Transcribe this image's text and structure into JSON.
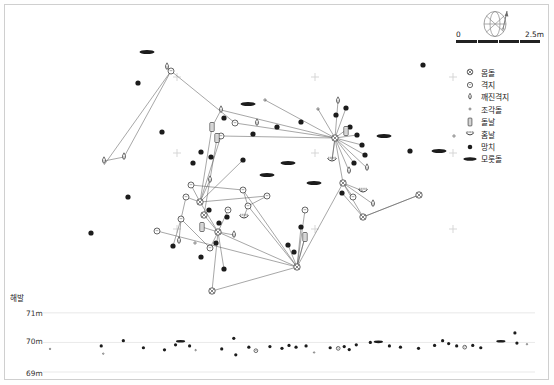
{
  "figure": {
    "type": "archaeological-artifact-distribution-map",
    "elevation_label": "해발",
    "elevation_ticks": [
      "71m",
      "70m",
      "69m"
    ]
  },
  "scalebar": {
    "min": "0",
    "max": "2.5m"
  },
  "compass": {
    "name": "north-arrow-compass-rose"
  },
  "legend": {
    "items": [
      {
        "symbol": "core-circle-cross",
        "label": "몸돌"
      },
      {
        "symbol": "flake-circle",
        "label": "격지"
      },
      {
        "symbol": "broken-flake-teardrop",
        "label": "깨진격지"
      },
      {
        "symbol": "fragment-tiny-dot",
        "label": "조각돌"
      },
      {
        "symbol": "blade-rectangle",
        "label": "돌날"
      },
      {
        "symbol": "notch-crescent",
        "label": "홈날"
      },
      {
        "symbol": "hammerstone-filled-dot",
        "label": "망치"
      },
      {
        "symbol": "anvil-ellipse",
        "label": "모룻돌"
      }
    ]
  },
  "chart_data": {
    "type": "scatter",
    "title": "",
    "xlabel": "",
    "ylabel": "해발",
    "grid": false,
    "legend_position": "right",
    "plan_view": {
      "xlim": [
        0,
        543
      ],
      "ylim": [
        0,
        285
      ],
      "grid_crosses": [
        [
          172,
          72
        ],
        [
          310,
          72
        ],
        [
          172,
          148
        ],
        [
          310,
          148
        ],
        [
          172,
          224
        ],
        [
          310,
          224
        ],
        [
          448,
          148
        ],
        [
          448,
          224
        ],
        [
          448,
          72
        ]
      ],
      "points": [
        {
          "t": "anvil",
          "x": 142,
          "y": 47
        },
        {
          "t": "anvil",
          "x": 243,
          "y": 99
        },
        {
          "t": "anvil",
          "x": 283,
          "y": 158
        },
        {
          "t": "anvil",
          "x": 309,
          "y": 178
        },
        {
          "t": "anvil",
          "x": 379,
          "y": 131
        },
        {
          "t": "anvil",
          "x": 434,
          "y": 146
        },
        {
          "t": "anvil",
          "x": 262,
          "y": 170
        },
        {
          "t": "hammer",
          "x": 133,
          "y": 78
        },
        {
          "t": "hammer",
          "x": 157,
          "y": 127
        },
        {
          "t": "hammer",
          "x": 123,
          "y": 192
        },
        {
          "t": "hammer",
          "x": 86,
          "y": 228
        },
        {
          "t": "hammer",
          "x": 219,
          "y": 113
        },
        {
          "t": "hammer",
          "x": 248,
          "y": 129
        },
        {
          "t": "hammer",
          "x": 272,
          "y": 122
        },
        {
          "t": "hammer",
          "x": 296,
          "y": 117
        },
        {
          "t": "hammer",
          "x": 331,
          "y": 110
        },
        {
          "t": "hammer",
          "x": 341,
          "y": 103
        },
        {
          "t": "hammer",
          "x": 345,
          "y": 122
        },
        {
          "t": "hammer",
          "x": 352,
          "y": 130
        },
        {
          "t": "hammer",
          "x": 357,
          "y": 140
        },
        {
          "t": "hammer",
          "x": 360,
          "y": 150
        },
        {
          "t": "hammer",
          "x": 349,
          "y": 158
        },
        {
          "t": "hammer",
          "x": 418,
          "y": 60
        },
        {
          "t": "hammer",
          "x": 405,
          "y": 146
        },
        {
          "t": "hammer",
          "x": 188,
          "y": 158
        },
        {
          "t": "hammer",
          "x": 204,
          "y": 205
        },
        {
          "t": "hammer",
          "x": 214,
          "y": 218
        },
        {
          "t": "hammer",
          "x": 222,
          "y": 212
        },
        {
          "t": "hammer",
          "x": 211,
          "y": 238
        },
        {
          "t": "hammer",
          "x": 196,
          "y": 252
        },
        {
          "t": "hammer",
          "x": 219,
          "y": 264
        },
        {
          "t": "hammer",
          "x": 283,
          "y": 240
        },
        {
          "t": "hammer",
          "x": 289,
          "y": 247
        },
        {
          "t": "hammer",
          "x": 296,
          "y": 222
        },
        {
          "t": "hammer",
          "x": 337,
          "y": 188
        },
        {
          "t": "hammer",
          "x": 168,
          "y": 241
        },
        {
          "t": "hammer",
          "x": 238,
          "y": 155
        },
        {
          "t": "hammer",
          "x": 196,
          "y": 147
        },
        {
          "t": "hammer",
          "x": 206,
          "y": 152
        },
        {
          "t": "core",
          "x": 195,
          "y": 197
        },
        {
          "t": "core",
          "x": 199,
          "y": 210
        },
        {
          "t": "core",
          "x": 213,
          "y": 227
        },
        {
          "t": "core",
          "x": 292,
          "y": 262
        },
        {
          "t": "core",
          "x": 207,
          "y": 286
        },
        {
          "t": "core",
          "x": 358,
          "y": 212
        },
        {
          "t": "core",
          "x": 414,
          "y": 190
        },
        {
          "t": "core",
          "x": 338,
          "y": 178
        },
        {
          "t": "core",
          "x": 330,
          "y": 133
        },
        {
          "t": "flake",
          "x": 166,
          "y": 66
        },
        {
          "t": "flake",
          "x": 216,
          "y": 131
        },
        {
          "t": "flake",
          "x": 230,
          "y": 118
        },
        {
          "t": "flake",
          "x": 238,
          "y": 185
        },
        {
          "t": "flake",
          "x": 262,
          "y": 191
        },
        {
          "t": "flake",
          "x": 186,
          "y": 180
        },
        {
          "t": "flake",
          "x": 176,
          "y": 214
        },
        {
          "t": "flake",
          "x": 152,
          "y": 226
        },
        {
          "t": "flake",
          "x": 205,
          "y": 243
        },
        {
          "t": "flake",
          "x": 243,
          "y": 201
        },
        {
          "t": "flake",
          "x": 300,
          "y": 205
        },
        {
          "t": "flake",
          "x": 181,
          "y": 192
        },
        {
          "t": "flake",
          "x": 223,
          "y": 205
        },
        {
          "t": "flake",
          "x": 348,
          "y": 192
        },
        {
          "t": "brokenflake",
          "x": 99,
          "y": 156
        },
        {
          "t": "brokenflake",
          "x": 119,
          "y": 152
        },
        {
          "t": "brokenflake",
          "x": 162,
          "y": 62
        },
        {
          "t": "brokenflake",
          "x": 216,
          "y": 105
        },
        {
          "t": "brokenflake",
          "x": 252,
          "y": 118
        },
        {
          "t": "brokenflake",
          "x": 333,
          "y": 96
        },
        {
          "t": "brokenflake",
          "x": 344,
          "y": 166
        },
        {
          "t": "brokenflake",
          "x": 362,
          "y": 163
        },
        {
          "t": "brokenflake",
          "x": 368,
          "y": 199
        },
        {
          "t": "brokenflake",
          "x": 205,
          "y": 175
        },
        {
          "t": "brokenflake",
          "x": 174,
          "y": 236
        },
        {
          "t": "brokenflake",
          "x": 229,
          "y": 230
        },
        {
          "t": "blade",
          "x": 207,
          "y": 122
        },
        {
          "t": "blade",
          "x": 212,
          "y": 133
        },
        {
          "t": "blade",
          "x": 341,
          "y": 126
        },
        {
          "t": "blade",
          "x": 197,
          "y": 222
        },
        {
          "t": "blade",
          "x": 300,
          "y": 232
        },
        {
          "t": "notch",
          "x": 327,
          "y": 155
        },
        {
          "t": "notch",
          "x": 358,
          "y": 186
        },
        {
          "t": "notch",
          "x": 239,
          "y": 212
        },
        {
          "t": "fragment",
          "x": 260,
          "y": 95
        },
        {
          "t": "fragment",
          "x": 313,
          "y": 104
        },
        {
          "t": "fragment",
          "x": 449,
          "y": 131
        },
        {
          "t": "fragment",
          "x": 190,
          "y": 238
        }
      ],
      "refit_lines": [
        [
          99,
          160,
          166,
          66
        ],
        [
          119,
          152,
          166,
          66
        ],
        [
          166,
          66,
          230,
          118
        ],
        [
          216,
          105,
          330,
          133
        ],
        [
          230,
          118,
          330,
          133
        ],
        [
          216,
          131,
          330,
          133
        ],
        [
          330,
          133,
          341,
          103
        ],
        [
          330,
          133,
          333,
          96
        ],
        [
          330,
          133,
          345,
          122
        ],
        [
          330,
          133,
          352,
          130
        ],
        [
          330,
          133,
          357,
          140
        ],
        [
          330,
          133,
          360,
          150
        ],
        [
          330,
          133,
          349,
          158
        ],
        [
          330,
          133,
          344,
          166
        ],
        [
          330,
          133,
          362,
          163
        ],
        [
          330,
          133,
          327,
          155
        ],
        [
          330,
          133,
          338,
          178
        ],
        [
          338,
          178,
          368,
          199
        ],
        [
          338,
          178,
          358,
          212
        ],
        [
          358,
          212,
          414,
          190
        ],
        [
          358,
          212,
          337,
          188
        ],
        [
          216,
          131,
          195,
          197
        ],
        [
          207,
          122,
          195,
          197
        ],
        [
          212,
          133,
          199,
          210
        ],
        [
          195,
          197,
          186,
          180
        ],
        [
          195,
          197,
          181,
          192
        ],
        [
          195,
          197,
          213,
          227
        ],
        [
          199,
          210,
          213,
          227
        ],
        [
          213,
          227,
          292,
          262
        ],
        [
          213,
          227,
          207,
          286
        ],
        [
          207,
          286,
          292,
          262
        ],
        [
          292,
          262,
          300,
          205
        ],
        [
          292,
          262,
          300,
          232
        ],
        [
          292,
          262,
          243,
          201
        ],
        [
          243,
          201,
          238,
          185
        ],
        [
          262,
          191,
          243,
          201
        ],
        [
          186,
          180,
          238,
          185
        ],
        [
          181,
          192,
          176,
          214
        ],
        [
          176,
          214,
          205,
          243
        ],
        [
          205,
          243,
          213,
          227
        ],
        [
          152,
          226,
          292,
          262
        ],
        [
          238,
          185,
          292,
          262
        ],
        [
          195,
          197,
          262,
          191
        ],
        [
          338,
          178,
          292,
          262
        ],
        [
          414,
          190,
          358,
          212
        ],
        [
          207,
          122,
          216,
          105
        ],
        [
          212,
          133,
          216,
          131
        ],
        [
          197,
          222,
          213,
          227
        ],
        [
          229,
          230,
          213,
          227
        ],
        [
          174,
          236,
          176,
          214
        ],
        [
          239,
          212,
          243,
          201
        ],
        [
          300,
          232,
          292,
          262
        ],
        [
          348,
          192,
          338,
          178
        ],
        [
          327,
          155,
          330,
          133
        ],
        [
          358,
          186,
          338,
          178
        ],
        [
          296,
          222,
          292,
          262
        ],
        [
          283,
          240,
          292,
          262
        ],
        [
          99,
          156,
          119,
          152
        ],
        [
          162,
          62,
          166,
          66
        ],
        [
          205,
          175,
          195,
          197
        ],
        [
          223,
          205,
          213,
          227
        ],
        [
          219,
          264,
          213,
          227
        ],
        [
          168,
          241,
          176,
          214
        ],
        [
          260,
          95,
          330,
          133
        ],
        [
          313,
          104,
          330,
          133
        ],
        [
          238,
          155,
          195,
          197
        ]
      ]
    },
    "profile_view": {
      "ylim": [
        69,
        71.3
      ],
      "yticks": [
        71,
        70,
        69
      ],
      "points": [
        {
          "t": "fragment",
          "x": 7,
          "y": 69.78
        },
        {
          "t": "fragment",
          "x": 60,
          "y": 69.62
        },
        {
          "t": "hammer",
          "x": 80,
          "y": 70.06
        },
        {
          "t": "hammer",
          "x": 100,
          "y": 69.82
        },
        {
          "t": "hammer",
          "x": 121,
          "y": 69.75
        },
        {
          "t": "anvil",
          "x": 137,
          "y": 70.04
        },
        {
          "t": "hammer",
          "x": 146,
          "y": 69.88
        },
        {
          "t": "hammer",
          "x": 132,
          "y": 69.92
        },
        {
          "t": "fragment",
          "x": 152,
          "y": 69.74
        },
        {
          "t": "hammer",
          "x": 178,
          "y": 69.78
        },
        {
          "t": "hammer",
          "x": 190,
          "y": 70.14
        },
        {
          "t": "hammer",
          "x": 205,
          "y": 69.84
        },
        {
          "t": "flake",
          "x": 212,
          "y": 69.72
        },
        {
          "t": "hammer",
          "x": 226,
          "y": 69.86
        },
        {
          "t": "hammer",
          "x": 238,
          "y": 69.8
        },
        {
          "t": "hammer",
          "x": 245,
          "y": 69.9
        },
        {
          "t": "hammer",
          "x": 252,
          "y": 69.84
        },
        {
          "t": "hammer",
          "x": 262,
          "y": 69.88
        },
        {
          "t": "fragment",
          "x": 270,
          "y": 69.66
        },
        {
          "t": "hammer",
          "x": 286,
          "y": 69.82
        },
        {
          "t": "flake",
          "x": 294,
          "y": 69.8
        },
        {
          "t": "hammer",
          "x": 300,
          "y": 69.86
        },
        {
          "t": "hammer",
          "x": 305,
          "y": 69.76
        },
        {
          "t": "hammer",
          "x": 312,
          "y": 69.92
        },
        {
          "t": "anvil",
          "x": 334,
          "y": 70.02
        },
        {
          "t": "hammer",
          "x": 326,
          "y": 70.0
        },
        {
          "t": "hammer",
          "x": 345,
          "y": 69.88
        },
        {
          "t": "hammer",
          "x": 356,
          "y": 69.84
        },
        {
          "t": "hammer",
          "x": 374,
          "y": 69.8
        },
        {
          "t": "hammer",
          "x": 390,
          "y": 69.9
        },
        {
          "t": "hammer",
          "x": 398,
          "y": 70.06
        },
        {
          "t": "hammer",
          "x": 404,
          "y": 69.96
        },
        {
          "t": "hammer",
          "x": 412,
          "y": 69.88
        },
        {
          "t": "flake",
          "x": 420,
          "y": 69.84
        },
        {
          "t": "hammer",
          "x": 428,
          "y": 69.9
        },
        {
          "t": "hammer",
          "x": 436,
          "y": 69.82
        },
        {
          "t": "anvil",
          "x": 456,
          "y": 70.04
        },
        {
          "t": "hammer",
          "x": 470,
          "y": 70.32
        },
        {
          "t": "hammer",
          "x": 472,
          "y": 69.98
        },
        {
          "t": "fragment",
          "x": 482,
          "y": 69.94
        },
        {
          "t": "hammer",
          "x": 192,
          "y": 69.58
        },
        {
          "t": "hammer",
          "x": 58,
          "y": 69.88
        }
      ]
    }
  }
}
